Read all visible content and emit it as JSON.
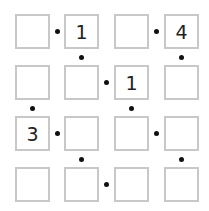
{
  "puzzle": {
    "type": "kropki-like grid",
    "rows": 4,
    "cols": 4,
    "cells": [
      [
        "",
        "1",
        "",
        "4"
      ],
      [
        "",
        "",
        "1",
        ""
      ],
      [
        "3",
        "",
        "",
        ""
      ],
      [
        "",
        "",
        "",
        ""
      ]
    ],
    "horizontal_dots": [
      [
        0,
        0
      ],
      [
        0,
        2
      ],
      [
        1,
        1
      ],
      [
        2,
        0
      ],
      [
        2,
        2
      ],
      [
        3,
        1
      ]
    ],
    "vertical_dots": [
      [
        0,
        1
      ],
      [
        0,
        3
      ],
      [
        1,
        0
      ],
      [
        1,
        2
      ],
      [
        2,
        1
      ],
      [
        2,
        3
      ]
    ],
    "dot_color": "#111111",
    "cell_border_color": "#c8c8c8"
  }
}
